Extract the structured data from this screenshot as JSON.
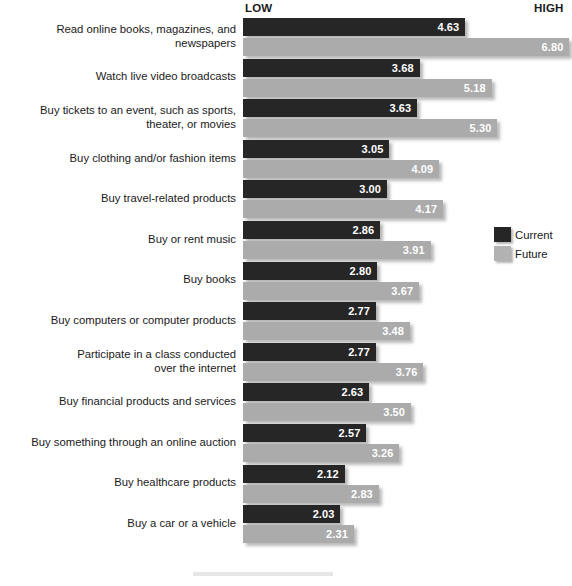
{
  "header": {
    "low_label": "LOW",
    "high_label": "HIGH"
  },
  "legend": {
    "position": "right",
    "items": [
      {
        "name": "current-series",
        "label": "Current",
        "color": "#262626"
      },
      {
        "name": "future-series",
        "label": "Future",
        "color": "#b2b2b2"
      }
    ]
  },
  "chart_data": {
    "type": "bar",
    "orientation": "horizontal",
    "title": "",
    "xlabel": "",
    "ylabel": "",
    "xlim": [
      0,
      7
    ],
    "grid": false,
    "axis_endpoint_labels": {
      "low": "LOW",
      "high": "HIGH"
    },
    "legend_position": "right",
    "categories": [
      "Read online books, magazines, and\nnewspapers",
      "Watch live video broadcasts",
      "Buy tickets to an event, such as sports,\ntheater, or movies",
      "Buy clothing and/or fashion items",
      "Buy travel-related products",
      "Buy or rent music",
      "Buy books",
      "Buy computers or computer products",
      "Participate in a class conducted\nover the internet",
      "Buy financial products and services",
      "Buy something through an online auction",
      "Buy healthcare products",
      "Buy a car or a vehicle"
    ],
    "series": [
      {
        "name": "Current",
        "color": "#262626",
        "values": [
          4.63,
          3.68,
          3.63,
          3.05,
          3.0,
          2.86,
          2.8,
          2.77,
          2.77,
          2.63,
          2.57,
          2.12,
          2.03
        ],
        "labels": [
          "4.63",
          "3.68",
          "3.63",
          "3.05",
          "3.00",
          "2.86",
          "2.80",
          "2.77",
          "2.77",
          "2.63",
          "2.57",
          "2.12",
          "2.03"
        ]
      },
      {
        "name": "Future",
        "color": "#ababab",
        "values": [
          6.8,
          5.18,
          5.3,
          4.09,
          4.17,
          3.91,
          3.67,
          3.48,
          3.76,
          3.5,
          3.26,
          2.83,
          2.31
        ],
        "labels": [
          "6.80",
          "5.18",
          "5.30",
          "4.09",
          "4.17",
          "3.91",
          "3.67",
          "3.48",
          "3.76",
          "3.50",
          "3.26",
          "2.83",
          "2.31"
        ]
      }
    ]
  },
  "render": {
    "bar_origin_x": 243,
    "px_per_unit": 48.0,
    "bar_height": 18,
    "bar_gap": 2,
    "group_pitch": 40.6,
    "plot_top": 18
  }
}
